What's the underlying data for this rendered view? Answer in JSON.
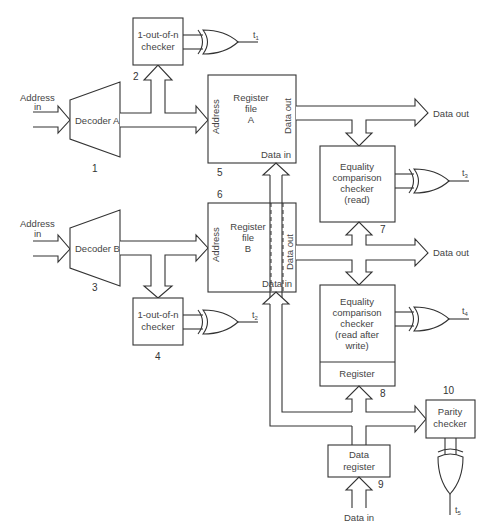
{
  "diagram": {
    "blocks": [
      {
        "id": 1,
        "name": "decoder-a",
        "label": "Decoder A",
        "number": "1"
      },
      {
        "id": 2,
        "name": "checker-a",
        "label_lines": [
          "1-out-of-n",
          "checker"
        ],
        "number": "2"
      },
      {
        "id": 3,
        "name": "decoder-b",
        "label": "Decoder B",
        "number": "3"
      },
      {
        "id": 4,
        "name": "checker-b",
        "label_lines": [
          "1-out-of-n",
          "checker"
        ],
        "number": "4"
      },
      {
        "id": 5,
        "name": "register-file-a",
        "label_lines": [
          "Register",
          "file",
          "A"
        ],
        "number": "5",
        "ports": {
          "address": "Address",
          "data_out": "Data out",
          "data_in": "Data in"
        }
      },
      {
        "id": 6,
        "name": "register-file-b",
        "label_lines": [
          "Register",
          "file",
          "B"
        ],
        "number": "6",
        "ports": {
          "address": "Address",
          "data_out": "Data out",
          "data_in": "Data in"
        }
      },
      {
        "id": 7,
        "name": "equality-read",
        "label_lines": [
          "Equality",
          "comparison",
          "checker",
          "(read)"
        ],
        "number": "7"
      },
      {
        "id": 8,
        "name": "equality-raw",
        "label_lines": [
          "Equality",
          "comparison",
          "checker",
          "(read after",
          "write)"
        ],
        "sub_label": "Register",
        "number": "8"
      },
      {
        "id": 9,
        "name": "data-register",
        "label_lines": [
          "Data",
          "register"
        ],
        "number": "9"
      },
      {
        "id": 10,
        "name": "parity-checker",
        "label_lines": [
          "Parity",
          "checker"
        ],
        "number": "10"
      }
    ],
    "inputs": {
      "address_a": [
        "Address",
        "in"
      ],
      "address_b": [
        "Address",
        "in"
      ],
      "data_in": "Data in"
    },
    "outputs": {
      "data_out_a": "Data out",
      "data_out_b": "Data out",
      "t1": "t1",
      "t2": "t2",
      "t3": "t3",
      "t4": "t4",
      "t5": "t5"
    },
    "gate_type": "XOR"
  }
}
